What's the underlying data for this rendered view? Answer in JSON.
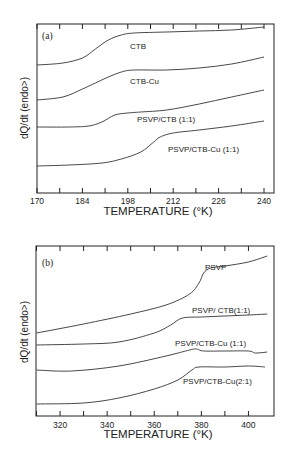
{
  "chart_data": [
    {
      "type": "line",
      "panel_label": "(a)",
      "xlabel": "TEMPERATURE (°K)",
      "ylabel": "dQ/dt (endo>)",
      "xlim": [
        170,
        242
      ],
      "xticks": [
        170,
        184,
        198,
        212,
        226,
        240
      ],
      "minor_xticks": [
        177,
        191,
        205,
        219,
        233
      ],
      "yticks_labeled": false,
      "grid": false,
      "series": [
        {
          "name": "CTB",
          "label_pos": [
            198,
            1
          ],
          "x": [
            170,
            178,
            184,
            188,
            192,
            196,
            200,
            210,
            220,
            230,
            240
          ],
          "y_px": [
            65,
            63,
            58,
            49,
            40,
            35,
            33,
            32,
            31,
            30,
            27
          ]
        },
        {
          "name": "CTB-Cu",
          "label_pos": [
            198,
            2
          ],
          "x": [
            170,
            178,
            184,
            188,
            192,
            196,
            200,
            210,
            220,
            230,
            240
          ],
          "y_px": [
            100,
            97,
            89,
            83,
            77,
            72,
            70,
            70,
            68,
            64,
            57
          ]
        },
        {
          "name": "PSVP/CTB (1:1)",
          "label_pos": [
            202,
            3
          ],
          "x": [
            170,
            180,
            186,
            190,
            194,
            198,
            202,
            210,
            220,
            230,
            240
          ],
          "y_px": [
            127,
            127,
            126,
            122,
            115,
            113,
            112,
            110,
            104,
            97,
            90
          ]
        },
        {
          "name": "PSVP/CTB-Cu (1:1)",
          "label_pos": [
            214,
            4
          ],
          "x": [
            170,
            180,
            190,
            196,
            202,
            206,
            208,
            212,
            220,
            230,
            240
          ],
          "y_px": [
            166,
            165,
            163,
            159,
            152,
            142,
            137,
            133,
            130,
            126,
            121
          ]
        }
      ]
    },
    {
      "type": "line",
      "panel_label": "(b)",
      "xlabel": "TEMPERATURE (°K)",
      "ylabel": "dQ/dt (endo>)",
      "xlim": [
        310,
        410
      ],
      "xticks": [
        320,
        340,
        360,
        380,
        400
      ],
      "minor_xticks": [
        310,
        330,
        350,
        370,
        390
      ],
      "yticks_labeled": false,
      "grid": false,
      "series": [
        {
          "name": "PSVP",
          "x": [
            310,
            330,
            350,
            365,
            375,
            379,
            381,
            384,
            390,
            400,
            408
          ],
          "y_px": [
            333,
            324,
            314,
            305,
            294,
            283,
            273,
            268,
            266,
            262,
            256
          ]
        },
        {
          "name": "PSVP/CTB (1:1)",
          "x": [
            310,
            330,
            345,
            360,
            367,
            372,
            380,
            390,
            400,
            408
          ],
          "y_px": [
            345,
            344,
            342,
            333,
            325,
            318,
            317,
            316,
            315,
            314
          ]
        },
        {
          "name": "PSVP/CTB-Cu (1:1)",
          "x": [
            310,
            325,
            345,
            365,
            375,
            378,
            381,
            390,
            400,
            403,
            408
          ],
          "y_px": [
            370,
            371,
            366,
            356,
            350,
            349,
            351,
            351,
            351,
            353,
            352
          ]
        },
        {
          "name": "PSVP/CTB-Cu (2:1)",
          "x": [
            310,
            330,
            345,
            360,
            370,
            376,
            379,
            390,
            400,
            407
          ],
          "y_px": [
            404,
            403,
            398,
            389,
            380,
            370,
            367,
            367,
            366,
            367
          ]
        }
      ]
    }
  ],
  "panels": {
    "a": {
      "label": "(a)",
      "xlabel": "TEMPERATURE (°K)",
      "ylabel": "dQ/dt (endo>)",
      "xtick_labels": [
        "170",
        "184",
        "198",
        "212",
        "226",
        "240"
      ],
      "series_labels": [
        "CTB",
        "CTB-Cu",
        "PSVP/CTB (1:1)",
        "PSVP/CTB-Cu (1:1)"
      ]
    },
    "b": {
      "label": "(b)",
      "xlabel": "TEMPERATURE (°K)",
      "ylabel": "dQ/dt (endo>)",
      "xtick_labels": [
        "320",
        "340",
        "360",
        "380",
        "400"
      ],
      "series_labels": [
        "PSVP",
        "PSVP/ CTB(1:1)",
        "PSVP/CTB-Cu (1:1)",
        "PSVP/CTB-Cu(2:1)"
      ]
    }
  }
}
